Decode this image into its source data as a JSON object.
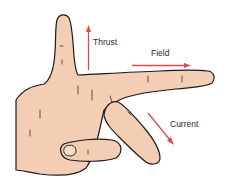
{
  "diagram": {
    "labels": {
      "thrust": "Thrust",
      "field": "Field",
      "current": "Current"
    },
    "colors": {
      "skin": "#f3cdb4",
      "outline": "#1f1a17",
      "arrow": "#e04a4a",
      "text": "#2a2a2a",
      "background": "#ffffff"
    }
  }
}
